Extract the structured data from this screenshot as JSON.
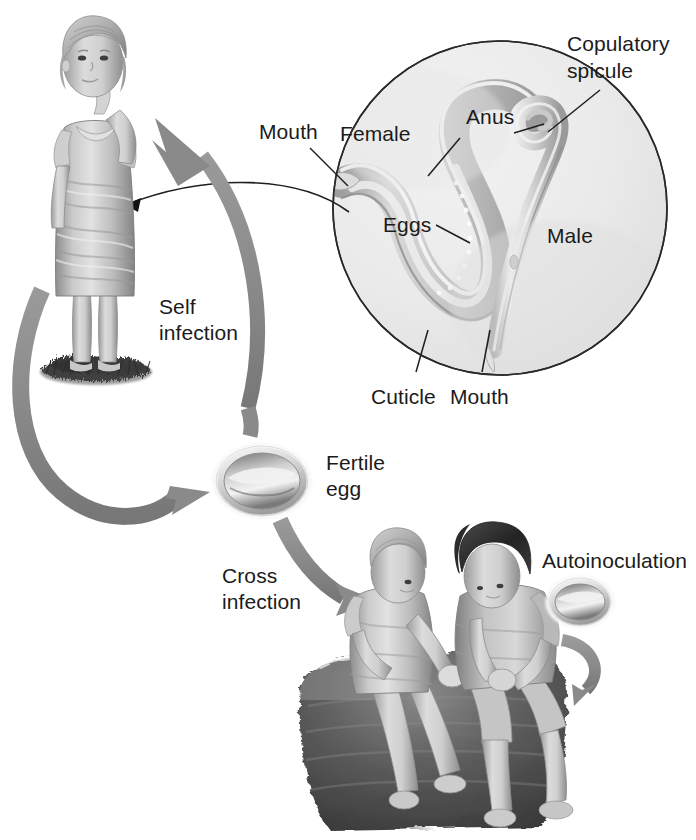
{
  "figure": {
    "background_color": "#ffffff",
    "arrow_color": "#8a8a8a",
    "arrow_color_dark": "#7b7b7b",
    "leader_line_color": "#1f1f1f",
    "inset_fill": "#ebebeb",
    "inset_border": "#2a2a2a",
    "text_color": "#1b1b1b"
  },
  "inset": {
    "name": "worm-detail-circle",
    "labels": {
      "mouth_left": "Mouth",
      "female": "Female",
      "anus": "Anus",
      "copulatory_spicule_line1": "Copulatory",
      "copulatory_spicule_line2": "spicule",
      "eggs": "Eggs",
      "male": "Male",
      "cuticle": "Cuticle",
      "mouth_bottom": "Mouth"
    }
  },
  "transmission": {
    "self_infection_line1": "Self",
    "self_infection_line2": "infection",
    "cross_infection_line1": "Cross",
    "cross_infection_line2": "infection",
    "autoinoculation": "Autoinoculation",
    "fertile_egg_line1": "Fertile",
    "fertile_egg_line2": "egg"
  },
  "figures": {
    "standing_girl": "standing-girl-hand-to-mouth",
    "seated_children": "two-seated-children",
    "fertile_egg": "fertile-egg",
    "autoinoculation_egg": "autoinoculation-egg",
    "grass_patch": "grass-patch",
    "rock_step": "rock-step"
  }
}
